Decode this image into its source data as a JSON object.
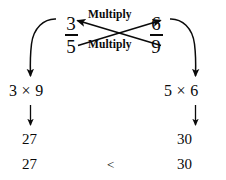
{
  "diagram": {
    "kind": "cross-multiplication-comparison",
    "colors": {
      "ink": "#0a0a0a",
      "background": "#ffffff"
    },
    "fractions": {
      "left": {
        "numerator": "3",
        "denominator": "5"
      },
      "right": {
        "numerator": "6",
        "denominator": "9"
      }
    },
    "labels": {
      "multiply_top": "Multiply",
      "multiply_bottom": "Multiply"
    },
    "products": {
      "left_expression": "3 × 9",
      "right_expression": "5 × 6",
      "left_value": "27",
      "right_value": "30"
    },
    "conclusion": {
      "left_value": "27",
      "operator": "<",
      "right_value": "30"
    },
    "arrows": {
      "cross_up_right": "arrow from 5 to 6",
      "cross_up_left": "arrow from 9 to 3",
      "curve_left": "arrow from 3 down to 3 × 9",
      "curve_right": "arrow from 6 down to 5 × 6",
      "down_left": "↓",
      "down_right": "↓"
    }
  }
}
